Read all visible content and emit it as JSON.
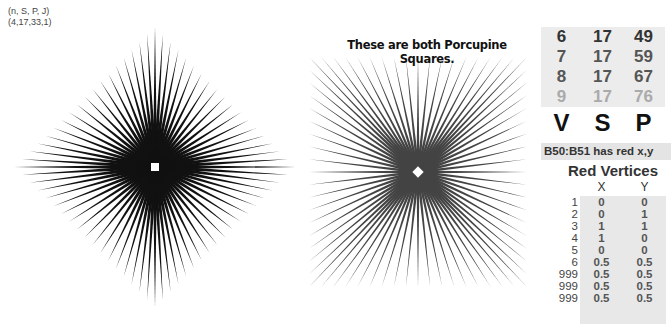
{
  "params": {
    "label": "(n, S, P, J)",
    "values": "(4,17,33,1)"
  },
  "caption": "These are both Porcupine Squares.",
  "figures": {
    "left": {
      "shape": "diamond",
      "center": [
        155,
        167
      ],
      "half_width": 141,
      "half_height": 141,
      "spikes": 72,
      "inner_square_size": 8,
      "color": "#111111"
    },
    "right": {
      "shape": "square",
      "center": [
        418,
        172
      ],
      "half_width": 109,
      "half_height": 115,
      "spikes": 72,
      "inner_diamond_size": 8,
      "color": "#444444"
    }
  },
  "vsp_table": {
    "rows": [
      {
        "v": "6",
        "s": "17",
        "p": "49",
        "color": "#333333"
      },
      {
        "v": "7",
        "s": "17",
        "p": "59",
        "color": "#555555"
      },
      {
        "v": "8",
        "s": "17",
        "p": "67",
        "color": "#555555"
      },
      {
        "v": "9",
        "s": "17",
        "p": "76",
        "color": "#aaaaaa"
      }
    ],
    "headers": {
      "v": "V",
      "s": "S",
      "p": "P"
    }
  },
  "note": "B50:B51 has red x,y",
  "red_vertices": {
    "title": "Red Vertices",
    "col_x": "X",
    "col_y": "Y",
    "rows": [
      {
        "i": "1",
        "x": "0",
        "y": "0"
      },
      {
        "i": "2",
        "x": "0",
        "y": "1"
      },
      {
        "i": "3",
        "x": "1",
        "y": "1"
      },
      {
        "i": "4",
        "x": "1",
        "y": "0"
      },
      {
        "i": "5",
        "x": "0",
        "y": "0"
      },
      {
        "i": "6",
        "x": "0.5",
        "y": "0.5"
      },
      {
        "i": "999",
        "x": "0.5",
        "y": "0.5"
      },
      {
        "i": "999",
        "x": "0.5",
        "y": "0.5"
      },
      {
        "i": "999",
        "x": "0.5",
        "y": "0.5"
      }
    ]
  }
}
